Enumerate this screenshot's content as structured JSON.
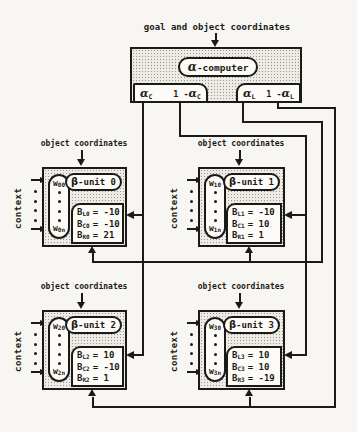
{
  "top_label": "goal and object coordinates",
  "alpha_computer": {
    "alpha": "α",
    "title_rest": "-computer"
  },
  "alpha_outputs": {
    "c": {
      "alpha": "α",
      "sub": "C",
      "pre": "1 - "
    },
    "l": {
      "alpha": "α",
      "sub": "L",
      "pre": "1 - "
    }
  },
  "labels": {
    "object_coordinates": "object coordinates",
    "context": "context",
    "w": "w",
    "b": "B",
    "beta": "β"
  },
  "units": [
    {
      "title_rest": "-unit 0",
      "w_top_sub": "00",
      "w_bot_sub": "0n",
      "rows": [
        {
          "sub": "L0",
          "val": "= -10"
        },
        {
          "sub": "C0",
          "val": "= -10"
        },
        {
          "sub": "R0",
          "val": "= 21"
        }
      ]
    },
    {
      "title_rest": "-unit 1",
      "w_top_sub": "10",
      "w_bot_sub": "1n",
      "rows": [
        {
          "sub": "L1",
          "val": "= -10"
        },
        {
          "sub": "C1",
          "val": "= 10"
        },
        {
          "sub": "R1",
          "val": "= 1"
        }
      ]
    },
    {
      "title_rest": "-unit 2",
      "w_top_sub": "20",
      "w_bot_sub": "2n",
      "rows": [
        {
          "sub": "L2",
          "val": "= 10"
        },
        {
          "sub": "C2",
          "val": "= -10"
        },
        {
          "sub": "R2",
          "val": "= 1"
        }
      ]
    },
    {
      "title_rest": "-unit 3",
      "w_top_sub": "30",
      "w_bot_sub": "3n",
      "rows": [
        {
          "sub": "L3",
          "val": "= 10"
        },
        {
          "sub": "C3",
          "val": "= 10"
        },
        {
          "sub": "R3",
          "val": "= -19"
        }
      ]
    }
  ],
  "colors": {
    "ink": "#1b1a16",
    "paper": "#f7f6f2",
    "panel_fill": "#edebe5",
    "inner_fill": "#fcfbf8"
  }
}
